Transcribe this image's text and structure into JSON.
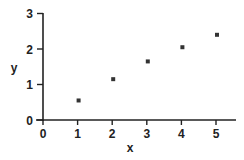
{
  "chart_data": {
    "type": "scatter",
    "title": "",
    "xlabel": "x",
    "ylabel": "y",
    "xlim": [
      0,
      5.5
    ],
    "ylim": [
      0,
      3
    ],
    "xticks": [
      "0",
      "1",
      "2",
      "3",
      "4",
      "5"
    ],
    "yticks": [
      "0",
      "1",
      "2",
      "3"
    ],
    "grid": false,
    "legend": null,
    "marker": "x",
    "series": [
      {
        "name": "data",
        "x": [
          1,
          2,
          3,
          4,
          5
        ],
        "y": [
          0.55,
          1.15,
          1.65,
          2.05,
          2.4
        ]
      }
    ],
    "colors": {
      "axis": "#222222",
      "marker": "#333333",
      "background": "#ffffff"
    }
  }
}
